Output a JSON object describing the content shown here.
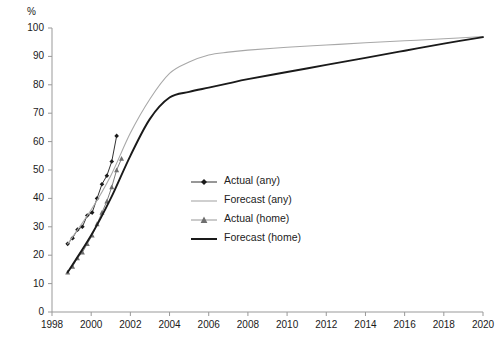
{
  "chart_data": {
    "type": "line",
    "title": "",
    "xlabel": "",
    "ylabel": "%",
    "xlim": [
      1998,
      2020
    ],
    "ylim": [
      0,
      100
    ],
    "grid": false,
    "legend_position": "center-left",
    "x_ticks": [
      "1998",
      "2000",
      "2002",
      "2004",
      "2006",
      "2008",
      "2010",
      "2012",
      "2014",
      "2016",
      "2018",
      "2020"
    ],
    "x_tick_values": [
      1998,
      2000,
      2002,
      2004,
      2006,
      2008,
      2010,
      2012,
      2014,
      2016,
      2018,
      2020
    ],
    "y_ticks": [
      "0",
      "10",
      "20",
      "30",
      "40",
      "50",
      "60",
      "70",
      "80",
      "90",
      "100"
    ],
    "y_tick_values": [
      0,
      10,
      20,
      30,
      40,
      50,
      60,
      70,
      80,
      90,
      100
    ],
    "series": [
      {
        "name": "Actual (any)",
        "style": "line-with-diamond-markers",
        "color": "#1a1a1a",
        "marker": "diamond",
        "x": [
          1998.8,
          1999.05,
          1999.3,
          1999.55,
          1999.8,
          2000.05,
          2000.3,
          2000.55,
          2000.8,
          2001.05,
          2001.3
        ],
        "y": [
          24,
          26,
          29,
          30,
          34,
          35,
          40,
          45,
          48,
          53,
          62
        ]
      },
      {
        "name": "Forecast (any)",
        "style": "thin-light-line",
        "color": "#a8a8a8",
        "marker": "none",
        "x": [
          1998.8,
          2000,
          2001,
          2002,
          2003,
          2004,
          2005,
          2006,
          2007,
          2008,
          2010,
          2012,
          2014,
          2016,
          2018,
          2020
        ],
        "y": [
          24,
          36,
          48,
          63,
          75,
          84,
          88,
          90.5,
          91.5,
          92.2,
          93.2,
          94,
          94.8,
          95.5,
          96.2,
          97
        ]
      },
      {
        "name": "Actual (home)",
        "style": "line-with-triangle-markers",
        "color": "#6e6e6e",
        "marker": "triangle",
        "x": [
          1998.8,
          1999.05,
          1999.3,
          1999.55,
          1999.8,
          2000.05,
          2000.3,
          2000.55,
          2000.8,
          2001.05,
          2001.3,
          2001.55
        ],
        "y": [
          14,
          16,
          19,
          21,
          24,
          27,
          31,
          35,
          39,
          44,
          50,
          54
        ]
      },
      {
        "name": "Forecast (home)",
        "style": "thick-dark-line",
        "color": "#1a1a1a",
        "marker": "none",
        "x": [
          1998.8,
          2000,
          2001,
          2002,
          2003,
          2004,
          2005,
          2006,
          2007,
          2008,
          2010,
          2012,
          2014,
          2016,
          2018,
          2020
        ],
        "y": [
          14,
          27,
          40,
          55,
          68,
          75.5,
          77.5,
          79,
          80.5,
          82,
          84.5,
          87,
          89.5,
          92,
          94.5,
          96.8
        ]
      }
    ]
  },
  "legend": {
    "items": [
      {
        "label": "Actual (any)"
      },
      {
        "label": "Forecast (any)"
      },
      {
        "label": "Actual (home)"
      },
      {
        "label": "Forecast (home)"
      }
    ]
  },
  "axis": {
    "unit_label": "%"
  }
}
